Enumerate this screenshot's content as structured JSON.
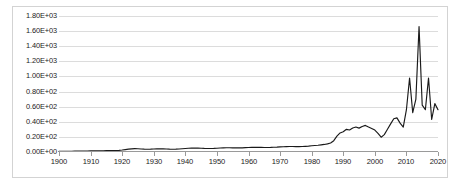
{
  "chart_data": {
    "type": "line",
    "title": "",
    "xlabel": "",
    "ylabel": "",
    "grid": true,
    "legend": false,
    "line_color": "#1a1a1a",
    "gridline_color": "#dcdcdc",
    "background_color": "#ffffff",
    "border_color": "#d3d3d3",
    "xlim": [
      1900,
      2020
    ],
    "ylim": [
      0,
      1800
    ],
    "y_tick_labels": [
      "1.80E+03",
      "1.60E+03",
      "1.40E+03",
      "1.20E+03",
      "1.00E+03",
      "0.80E+02",
      "0.60E+02",
      "0.40E+02",
      "0.20E+02",
      "0.00E+00"
    ],
    "y_tick_values": [
      1800,
      1600,
      1400,
      1200,
      1000,
      800,
      600,
      400,
      200,
      0
    ],
    "x_tick_labels": [
      "1900",
      "1910",
      "1920",
      "1930",
      "1940",
      "1950",
      "1960",
      "1970",
      "1980",
      "1990",
      "2000",
      "2010",
      "2020"
    ],
    "x_tick_values": [
      1900,
      1910,
      1920,
      1930,
      1940,
      1950,
      1960,
      1970,
      1980,
      1990,
      2000,
      2010,
      2020
    ],
    "series": [
      {
        "name": "series-1",
        "x": [
          1900,
          1901,
          1902,
          1903,
          1904,
          1905,
          1906,
          1907,
          1908,
          1909,
          1910,
          1911,
          1912,
          1913,
          1914,
          1915,
          1916,
          1917,
          1918,
          1919,
          1920,
          1921,
          1922,
          1923,
          1924,
          1925,
          1926,
          1927,
          1928,
          1929,
          1930,
          1931,
          1932,
          1933,
          1934,
          1935,
          1936,
          1937,
          1938,
          1939,
          1940,
          1941,
          1942,
          1943,
          1944,
          1945,
          1946,
          1947,
          1948,
          1949,
          1950,
          1951,
          1952,
          1953,
          1954,
          1955,
          1956,
          1957,
          1958,
          1959,
          1960,
          1961,
          1962,
          1963,
          1964,
          1965,
          1966,
          1967,
          1968,
          1969,
          1970,
          1971,
          1972,
          1973,
          1974,
          1975,
          1976,
          1977,
          1978,
          1979,
          1980,
          1981,
          1982,
          1983,
          1984,
          1985,
          1986,
          1987,
          1988,
          1989,
          1990,
          1991,
          1992,
          1993,
          1994,
          1995,
          1996,
          1997,
          1998,
          1999,
          2000,
          2001,
          2002,
          2003,
          2004,
          2005,
          2006,
          2007,
          2008,
          2009,
          2010,
          2011,
          2012,
          2013,
          2014,
          2015,
          2016,
          2017,
          2018,
          2019,
          2020
        ],
        "values": [
          8,
          9,
          9,
          10,
          10,
          11,
          11,
          12,
          12,
          13,
          14,
          15,
          15,
          16,
          17,
          18,
          19,
          20,
          20,
          21,
          26,
          32,
          38,
          42,
          44,
          43,
          40,
          38,
          37,
          38,
          40,
          42,
          43,
          42,
          40,
          38,
          37,
          38,
          40,
          43,
          46,
          50,
          52,
          53,
          52,
          50,
          48,
          47,
          47,
          48,
          50,
          53,
          55,
          56,
          56,
          55,
          54,
          54,
          55,
          57,
          59,
          61,
          62,
          62,
          61,
          60,
          60,
          61,
          63,
          65,
          68,
          70,
          72,
          73,
          73,
          72,
          72,
          73,
          75,
          78,
          82,
          86,
          90,
          95,
          100,
          108,
          120,
          150,
          210,
          252,
          268,
          300,
          292,
          318,
          330,
          316,
          338,
          352,
          330,
          312,
          290,
          246,
          196,
          230,
          300,
          372,
          440,
          452,
          382,
          330,
          560,
          980,
          520,
          700,
          1660,
          620,
          560,
          980,
          430,
          640,
          560
        ]
      }
    ]
  }
}
